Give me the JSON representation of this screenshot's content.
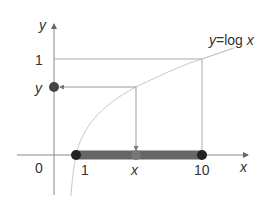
{
  "diagram": {
    "type": "function-graph",
    "function_label": "y=log x",
    "function_label_parts": {
      "y": "y",
      "eq": "=log ",
      "x": "x"
    },
    "axes": {
      "x_label": "x",
      "y_label": "y",
      "origin_label": "0"
    },
    "x_ticks": [
      {
        "label": "1",
        "value": 1
      },
      {
        "label": "x",
        "value": "x"
      },
      {
        "label": "10",
        "value": 10
      }
    ],
    "y_ticks": [
      {
        "label": "1",
        "value": 1
      },
      {
        "label": "y",
        "value": "y"
      }
    ],
    "highlighted_interval": {
      "from": "1",
      "to": "10"
    },
    "colors": {
      "axis": "#888888",
      "curve": "#c8c8c8",
      "guide_lines": "#aaaaaa",
      "interval_bar": "#666666",
      "endpoint_dots": "#222222",
      "mid_dot": "#777777",
      "y_dot": "#444444"
    }
  }
}
